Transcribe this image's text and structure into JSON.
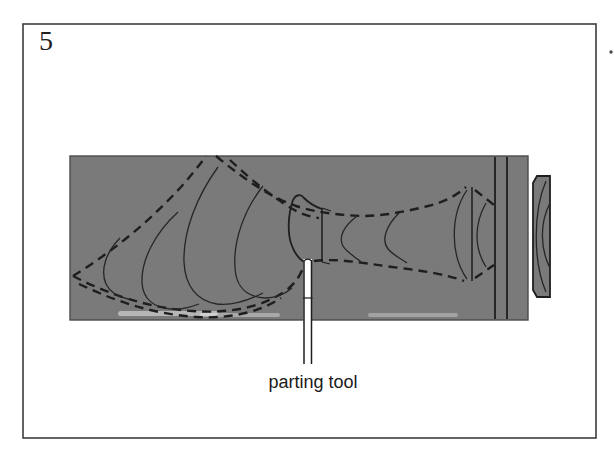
{
  "figure": {
    "number": "5",
    "caption_label": "parting tool"
  },
  "colors": {
    "wood_gray": "#7a7a7a",
    "ink": "#1e1e1e",
    "frame": "#3d3d3d",
    "paper": "#ffffff"
  }
}
